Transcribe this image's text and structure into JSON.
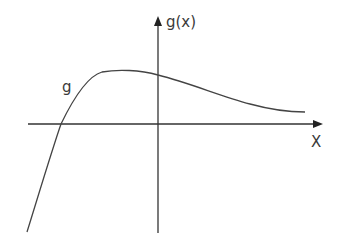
{
  "diagram": {
    "function_label": "g",
    "y_axis_label": "g(x)",
    "x_axis_label": "X",
    "colors": {
      "axis": "#333333",
      "curve": "#444444",
      "text": "#3a3a3a",
      "background": "#ffffff"
    }
  }
}
